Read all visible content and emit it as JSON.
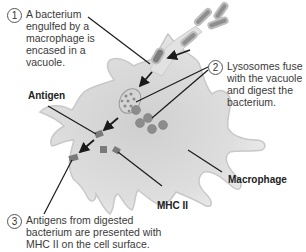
{
  "figure": {
    "steps": [
      {
        "number": "1",
        "text": "A bacterium engulfed by a macrophage is encased in a vacuole."
      },
      {
        "number": "2",
        "text": "Lysosomes fuse with the vacuole and digest the bacterium."
      },
      {
        "number": "3",
        "text": "Antigens from digested bacterium are presented with MHC II on the cell surface."
      }
    ],
    "labels": {
      "antigen": "Antigen",
      "mhc": "MHC II",
      "macrophage": "Macrophage"
    },
    "colors": {
      "cell_fill": "#dcdcdc",
      "cell_outline": "#c4c4c4",
      "lysosome": "#8c8c8c",
      "bacterium": "#909090",
      "antigen": "#7a7a7a",
      "arrow": "#1a1a1a"
    }
  }
}
